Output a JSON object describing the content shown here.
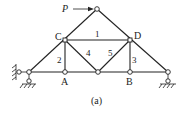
{
  "figure": {
    "caption": "(a)",
    "load": {
      "label": "P",
      "direction": "right"
    },
    "nodes": [
      {
        "id": "apex",
        "label": "",
        "x": 97,
        "y": 9
      },
      {
        "id": "C",
        "label": "C",
        "x": 65,
        "y": 40
      },
      {
        "id": "D",
        "label": "D",
        "x": 130,
        "y": 40
      },
      {
        "id": "left",
        "label": "",
        "x": 29,
        "y": 72
      },
      {
        "id": "A",
        "label": "A",
        "x": 65,
        "y": 72
      },
      {
        "id": "mid",
        "label": "",
        "x": 98,
        "y": 72
      },
      {
        "id": "B",
        "label": "B",
        "x": 130,
        "y": 72
      },
      {
        "id": "right",
        "label": "",
        "x": 168,
        "y": 72
      }
    ],
    "member_labels": [
      "1",
      "2",
      "3",
      "4",
      "5"
    ],
    "supports": [
      {
        "node": "left",
        "type": "fixed-pin"
      },
      {
        "node": "right",
        "type": "roller"
      }
    ]
  }
}
